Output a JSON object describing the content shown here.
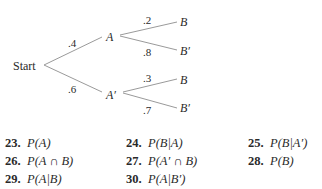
{
  "tree": {
    "root": "Start",
    "level1": [
      {
        "label": "A",
        "prob": ".4",
        "children": [
          {
            "label": "B",
            "prob": ".2"
          },
          {
            "label": "B′",
            "prob": ".8"
          }
        ]
      },
      {
        "label": "A′",
        "prob": ".6",
        "children": [
          {
            "label": "B",
            "prob": ".3"
          },
          {
            "label": "B′",
            "prob": ".7"
          }
        ]
      }
    ]
  },
  "problems": [
    {
      "num": "23.",
      "expr": "P(A)"
    },
    {
      "num": "24.",
      "expr": "P(B|A)"
    },
    {
      "num": "25.",
      "expr": "P(B|A′)"
    },
    {
      "num": "26.",
      "expr": "P(A ∩ B)"
    },
    {
      "num": "27.",
      "expr": "P(A′ ∩ B)"
    },
    {
      "num": "28.",
      "expr": "P(B)"
    },
    {
      "num": "29.",
      "expr": "P(A|B)"
    },
    {
      "num": "30.",
      "expr": "P(A|B′)"
    }
  ],
  "colors": {
    "line": "#9a9a9a",
    "text": "#2a2a2a"
  }
}
